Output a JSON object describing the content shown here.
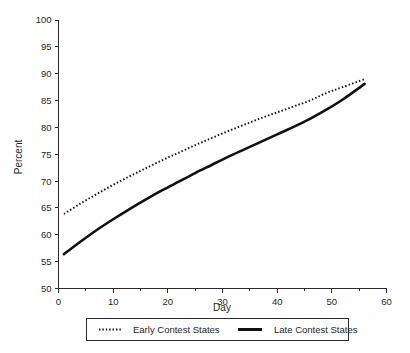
{
  "chart_data": {
    "type": "line",
    "title": "",
    "xlabel": "Day",
    "ylabel": "Percent",
    "xlim": [
      0,
      60
    ],
    "ylim": [
      50,
      100
    ],
    "xticks": [
      0,
      10,
      20,
      30,
      40,
      50,
      60
    ],
    "xtick_labels": [
      "0",
      "10",
      "20",
      "30",
      "40",
      "50",
      "60"
    ],
    "xminor_ticks": [
      5,
      15,
      25,
      35,
      45,
      55
    ],
    "yticks": [
      50,
      55,
      60,
      65,
      70,
      75,
      80,
      85,
      90,
      95,
      100
    ],
    "ytick_labels": [
      "50",
      "55",
      "60",
      "65",
      "70",
      "75",
      "80",
      "85",
      "90",
      "95",
      "100"
    ],
    "grid": false,
    "legend_position": "below-outside",
    "x": [
      1,
      4,
      7,
      10,
      13,
      16,
      19,
      22,
      25,
      28,
      31,
      34,
      37,
      40,
      43,
      46,
      49,
      52,
      56
    ],
    "series": [
      {
        "name": "Early Contest States",
        "style": "dotted",
        "color": "#111111",
        "values": [
          63.9,
          65.8,
          67.6,
          69.3,
          70.9,
          72.4,
          73.9,
          75.3,
          76.7,
          78.0,
          79.3,
          80.5,
          81.7,
          82.8,
          83.9,
          85.0,
          86.4,
          87.5,
          89.0
        ]
      },
      {
        "name": "Late Contest States",
        "style": "solid",
        "color": "#111111",
        "values": [
          56.4,
          58.7,
          60.9,
          62.9,
          64.8,
          66.6,
          68.3,
          69.9,
          71.5,
          73.0,
          74.5,
          75.9,
          77.3,
          78.7,
          80.1,
          81.6,
          83.3,
          85.2,
          88.1
        ]
      }
    ]
  },
  "legend": {
    "entries": [
      {
        "label": "Early Contest States",
        "style": "dotted"
      },
      {
        "label": "Late Contest States",
        "style": "solid"
      }
    ]
  },
  "colors": {
    "background": "#ffffff",
    "ink": "#111111",
    "axis": "#2b2b2b"
  }
}
